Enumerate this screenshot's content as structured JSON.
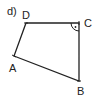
{
  "diagram": {
    "part_label": "d)",
    "shape": "quadrilateral",
    "vertices": {
      "A": {
        "label": "A",
        "x": 14,
        "y": 56
      },
      "B": {
        "label": "B",
        "x": 79,
        "y": 81
      },
      "C": {
        "label": "C",
        "x": 79,
        "y": 23
      },
      "D": {
        "label": "D",
        "x": 26,
        "y": 23
      }
    },
    "right_angle_at": "C",
    "colors": {
      "stroke": "#222222",
      "background": "#ffffff"
    }
  }
}
